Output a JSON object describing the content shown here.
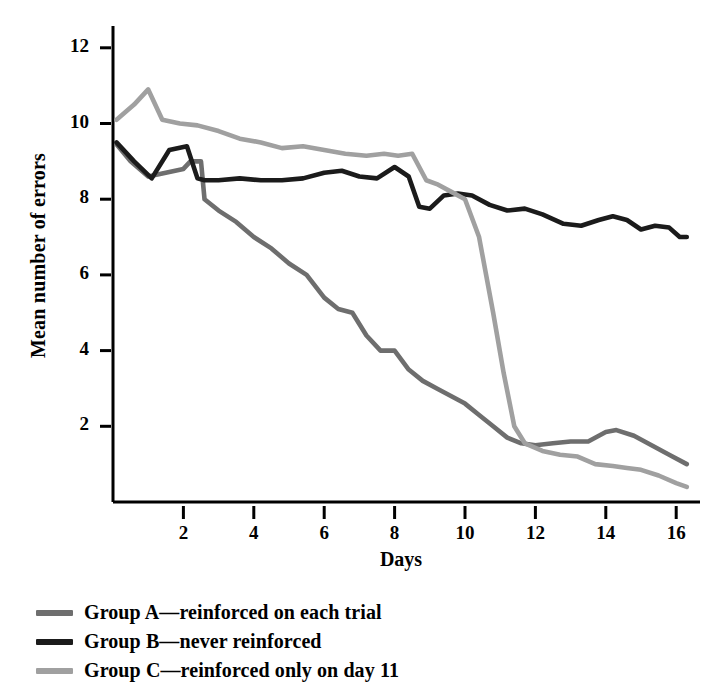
{
  "chart_data": {
    "type": "line",
    "title": "",
    "xlabel": "Days",
    "ylabel": "Mean number of errors",
    "xlim": [
      0,
      16.5
    ],
    "ylim": [
      0,
      12.6
    ],
    "xticks": [
      2,
      4,
      6,
      8,
      10,
      12,
      14,
      16
    ],
    "xtick_labels": [
      "2",
      "4",
      "6",
      "8",
      "10",
      "12",
      "14",
      "16"
    ],
    "yticks": [
      2,
      4,
      6,
      8,
      10,
      12
    ],
    "ytick_labels": [
      "2",
      "4",
      "6",
      "8",
      "10",
      "12"
    ],
    "grid": false,
    "legend_position": "below-plot",
    "series": [
      {
        "name": "Group A—reinforced on each trial",
        "color": "#6e6e6e",
        "x": [
          0.1,
          0.5,
          1.0,
          1.5,
          2.0,
          2.2,
          2.5,
          2.6,
          3.0,
          3.5,
          4.0,
          4.5,
          5.0,
          5.5,
          6.0,
          6.4,
          6.8,
          7.2,
          7.6,
          8.0,
          8.4,
          8.8,
          9.2,
          9.6,
          10.0,
          10.4,
          10.8,
          11.2,
          11.6,
          12.0,
          12.5,
          13.0,
          13.5,
          14.0,
          14.3,
          14.8,
          15.3,
          15.8,
          16.3
        ],
        "y": [
          9.45,
          9.0,
          8.6,
          8.7,
          8.8,
          9.0,
          9.0,
          8.0,
          7.7,
          7.4,
          7.0,
          6.7,
          6.3,
          6.0,
          5.4,
          5.1,
          5.0,
          4.4,
          4.0,
          4.0,
          3.5,
          3.2,
          3.0,
          2.8,
          2.6,
          2.3,
          2.0,
          1.7,
          1.55,
          1.5,
          1.55,
          1.6,
          1.6,
          1.85,
          1.9,
          1.75,
          1.5,
          1.25,
          1.0
        ]
      },
      {
        "name": "Group B—never reinforced",
        "color": "#1b1b1b",
        "x": [
          0.1,
          0.6,
          1.1,
          1.6,
          2.1,
          2.4,
          2.6,
          3.0,
          3.6,
          4.2,
          4.8,
          5.4,
          6.0,
          6.5,
          7.0,
          7.5,
          8.0,
          8.4,
          8.7,
          9.0,
          9.4,
          9.8,
          10.2,
          10.7,
          11.2,
          11.7,
          12.2,
          12.8,
          13.3,
          13.8,
          14.2,
          14.6,
          15.0,
          15.4,
          15.8,
          16.1,
          16.3
        ],
        "y": [
          9.5,
          9.0,
          8.55,
          9.3,
          9.4,
          8.55,
          8.5,
          8.5,
          8.55,
          8.5,
          8.5,
          8.55,
          8.7,
          8.75,
          8.6,
          8.55,
          8.85,
          8.6,
          7.8,
          7.75,
          8.1,
          8.15,
          8.1,
          7.85,
          7.7,
          7.75,
          7.6,
          7.35,
          7.3,
          7.45,
          7.55,
          7.45,
          7.2,
          7.3,
          7.25,
          7.0,
          7.0
        ]
      },
      {
        "name": "Group C—reinforced only on day 11",
        "color": "#a0a0a0",
        "x": [
          0.1,
          0.6,
          1.0,
          1.4,
          1.9,
          2.4,
          3.0,
          3.6,
          4.2,
          4.8,
          5.4,
          6.0,
          6.6,
          7.2,
          7.7,
          8.1,
          8.5,
          8.9,
          9.2,
          9.6,
          10.0,
          10.4,
          10.8,
          11.1,
          11.4,
          11.7,
          12.2,
          12.7,
          13.2,
          13.7,
          14.2,
          14.6,
          15.0,
          15.5,
          16.0,
          16.3
        ],
        "y": [
          10.1,
          10.5,
          10.9,
          10.1,
          10.0,
          9.95,
          9.8,
          9.6,
          9.5,
          9.35,
          9.4,
          9.3,
          9.2,
          9.15,
          9.2,
          9.15,
          9.2,
          8.5,
          8.4,
          8.2,
          8.0,
          7.0,
          5.0,
          3.4,
          2.0,
          1.55,
          1.35,
          1.25,
          1.2,
          1.0,
          0.95,
          0.9,
          0.85,
          0.7,
          0.5,
          0.4
        ]
      }
    ]
  },
  "axis": {
    "y_title": "Mean number of errors",
    "x_title": "Days"
  },
  "legend": {
    "items": [
      {
        "label": "Group A—reinforced on each trial",
        "color": "#6e6e6e"
      },
      {
        "label": "Group B—never reinforced",
        "color": "#1b1b1b"
      },
      {
        "label": "Group C—reinforced only on day 11",
        "color": "#a0a0a0"
      }
    ]
  }
}
